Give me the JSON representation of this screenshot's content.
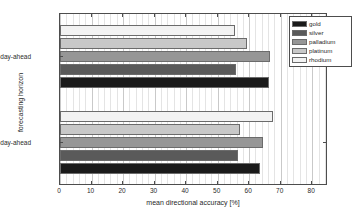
{
  "chart_data": {
    "type": "bar",
    "orientation": "horizontal",
    "title": "",
    "xlabel": "mean directional accuracy [%]",
    "ylabel": "forecasting horizon",
    "categories": [
      "1-day-ahead",
      "5-day-ahead"
    ],
    "series": [
      {
        "name": "gold",
        "color": "#1a1a1a",
        "values": [
          63.5,
          66.2
        ]
      },
      {
        "name": "silver",
        "color": "#5a5a5a",
        "values": [
          56.6,
          55.7
        ]
      },
      {
        "name": "palladium",
        "color": "#969696",
        "values": [
          64.4,
          66.5
        ]
      },
      {
        "name": "platinum",
        "color": "#c8c8c8",
        "values": [
          57.2,
          59.3
        ]
      },
      {
        "name": "rhodium",
        "color": "#f2f2f2",
        "values": [
          67.7,
          55.4
        ]
      }
    ],
    "xlim": [
      0,
      85
    ],
    "xticks": [
      0,
      10,
      20,
      30,
      40,
      50,
      60,
      70,
      80
    ],
    "xticklabels": [
      "0",
      "10",
      "20",
      "30",
      "40",
      "50",
      "60",
      "70",
      "80"
    ],
    "grid": true,
    "grid_axis": "x",
    "legend_position": "upper right",
    "legend_entries": [
      "gold",
      "silver",
      "palladium",
      "platinum",
      "rhodium"
    ],
    "bar_edge_color": "#6b6b6b",
    "axis_color": "#4d4d4d",
    "background": "#ffffff"
  }
}
